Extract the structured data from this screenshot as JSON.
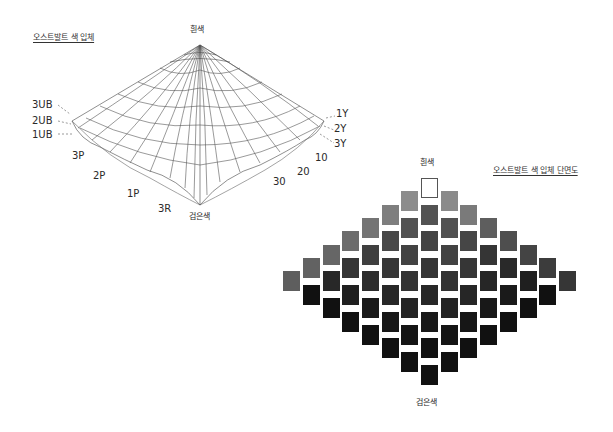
{
  "solid": {
    "title": "오스트발트 색 입체",
    "top_label": "흰색",
    "bottom_label": "검은색",
    "left_labels": [
      "3UB",
      "2UB",
      "1UB"
    ],
    "front_left_labels": [
      "3P",
      "2P",
      "1P",
      "3R"
    ],
    "right_labels": [
      "1Y",
      "2Y",
      "3Y"
    ],
    "front_right_labels": [
      "10",
      "20",
      "30"
    ]
  },
  "section": {
    "title": "오스트발트 색 입체 단면도",
    "top_label": "흰색",
    "bottom_label": "검은색",
    "columns": 15,
    "center_column_squares": 8,
    "colors": {
      "white": "#ffffff",
      "left_light": [
        "#8c8c8c",
        "#7e7e7e",
        "#747474",
        "#6c6c6c",
        "#666666",
        "#626262",
        "#5e5e5e"
      ],
      "right_light": [
        "#8a8a8a",
        "#7a7a7a",
        "#5e5e5e",
        "#4e4e4e",
        "#444444",
        "#3c3c3c",
        "#363636"
      ],
      "dark": "#111111"
    }
  }
}
